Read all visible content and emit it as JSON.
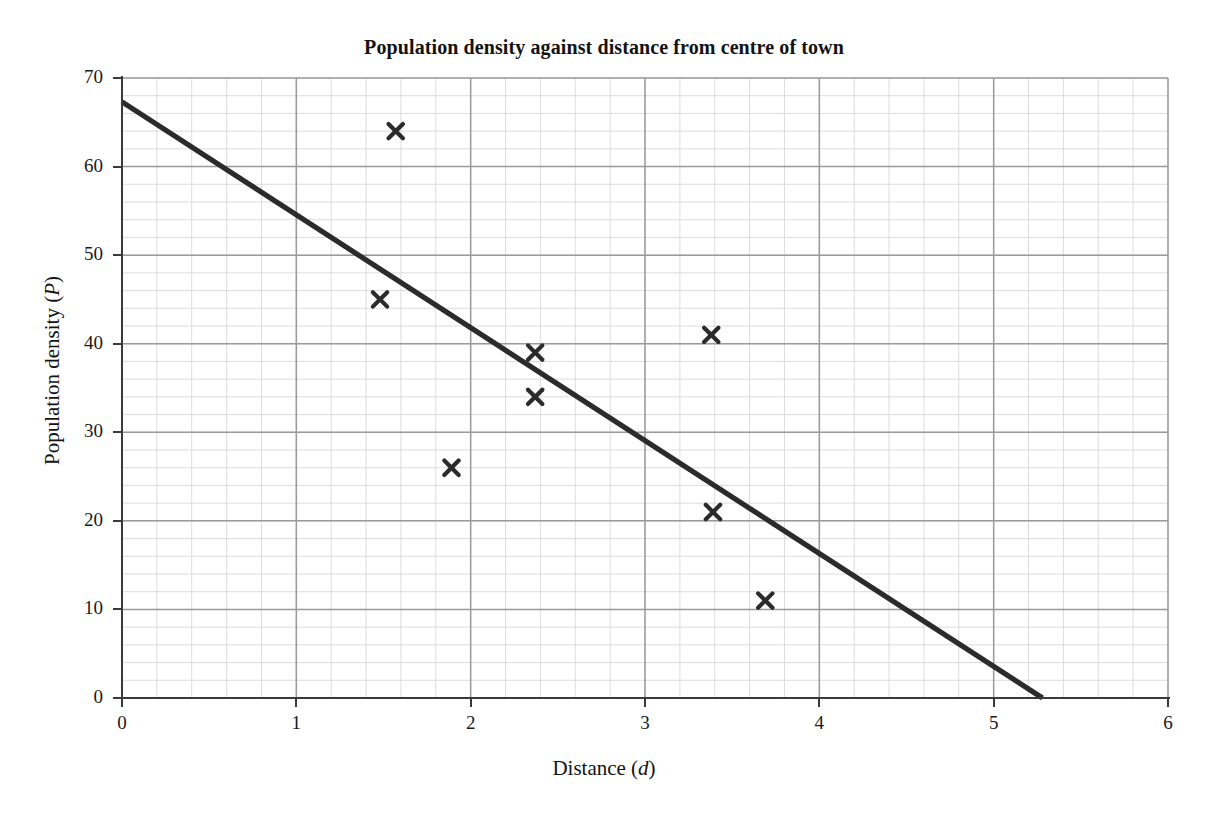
{
  "chart_data": {
    "type": "scatter",
    "title": "Population density against distance from centre of town",
    "xlabel": "Distance (d)",
    "xlabel_text": "Distance",
    "xlabel_symbol": "d",
    "ylabel": "Population density (P)",
    "ylabel_text": "Population density",
    "ylabel_symbol": "P",
    "xlim": [
      0,
      6
    ],
    "ylim": [
      0,
      70
    ],
    "x_ticks": [
      0,
      1,
      2,
      3,
      4,
      5,
      6
    ],
    "y_ticks": [
      0,
      10,
      20,
      30,
      40,
      50,
      60,
      70
    ],
    "x_minor_step": 0.2,
    "y_minor_step": 2,
    "grid": true,
    "legend": null,
    "marker": "x-cross",
    "marker_color": "#2b2b2b",
    "points": [
      {
        "x": 1.57,
        "y": 64
      },
      {
        "x": 1.48,
        "y": 45
      },
      {
        "x": 1.89,
        "y": 26
      },
      {
        "x": 2.37,
        "y": 39
      },
      {
        "x": 2.37,
        "y": 34
      },
      {
        "x": 3.38,
        "y": 41
      },
      {
        "x": 3.39,
        "y": 21
      },
      {
        "x": 3.69,
        "y": 11
      }
    ],
    "series": [
      {
        "name": "line of best fit",
        "type": "line",
        "color": "#2b2b2b",
        "x": [
          0,
          5.28
        ],
        "y": [
          67.3,
          0
        ]
      }
    ]
  },
  "colors": {
    "major_grid": "#9a9a9a",
    "minor_grid": "#d8d8d8",
    "axis": "#3a3a3a",
    "ink": "#1a1a1a",
    "background": "#ffffff"
  }
}
